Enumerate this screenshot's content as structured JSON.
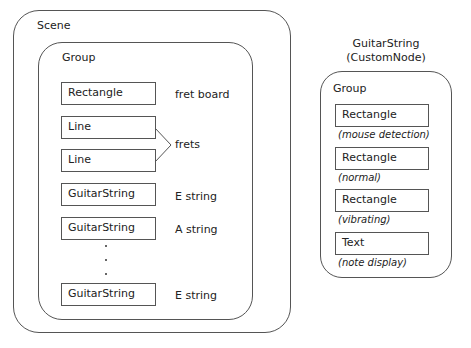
{
  "scene": {
    "title": "Scene",
    "group": {
      "title": "Group",
      "nodes": [
        {
          "label": "Rectangle",
          "annotation": "fret board"
        },
        {
          "label": "Line",
          "annotation": ""
        },
        {
          "label": "Line",
          "annotation": ""
        },
        {
          "label": "GuitarString",
          "annotation": "E string"
        },
        {
          "label": "GuitarString",
          "annotation": "A string"
        },
        {
          "label": "GuitarString",
          "annotation": "E string"
        }
      ],
      "frets_label": "frets"
    }
  },
  "custom_node": {
    "title_line1": "GuitarString",
    "title_line2": "(CustomNode)",
    "group": {
      "title": "Group",
      "nodes": [
        {
          "label": "Rectangle",
          "note": "(mouse detection)"
        },
        {
          "label": "Rectangle",
          "note": "(normal)"
        },
        {
          "label": "Rectangle",
          "note": "(vibrating)"
        },
        {
          "label": "Text",
          "note": "(note display)"
        }
      ]
    }
  }
}
